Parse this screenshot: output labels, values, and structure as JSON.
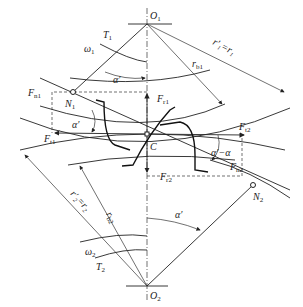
{
  "diagram": {
    "points": {
      "O1": {
        "label": "O",
        "sub": "1"
      },
      "O2": {
        "label": "O",
        "sub": "2"
      },
      "C": {
        "label": "C"
      },
      "N1": {
        "label": "N",
        "sub": "1"
      },
      "N2": {
        "label": "N",
        "sub": "2"
      }
    },
    "labels": {
      "T1": {
        "label": "T",
        "sub": "1"
      },
      "T2": {
        "label": "T",
        "sub": "2"
      },
      "omega1": {
        "label": "ω",
        "sub": "1"
      },
      "omega2": {
        "label": "ω",
        "sub": "2"
      },
      "alpha_top": "α′",
      "alpha_left": "α′",
      "alpha_bottom": "α′",
      "alpha_diff": "α′−α",
      "rb1": {
        "label": "r",
        "sub": "b1"
      },
      "rb2": {
        "label": "r",
        "sub": "b2"
      },
      "r1": "r′₁=r₁",
      "r2": "r′₂=r₂",
      "Fn1": {
        "label": "F",
        "sub": "n1"
      },
      "Fn2": {
        "label": "F",
        "sub": "n2"
      },
      "Ft1": {
        "label": "F",
        "sub": "t1"
      },
      "Ft2": {
        "label": "F",
        "sub": "t2"
      },
      "Fr1": {
        "label": "F",
        "sub": "r1"
      },
      "Fr2": {
        "label": "F",
        "sub": "r2"
      }
    },
    "colors": {
      "line": "#222222",
      "background": "#ffffff"
    }
  }
}
